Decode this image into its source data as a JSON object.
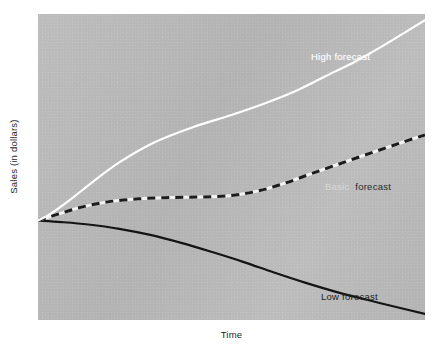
{
  "chart_data": {
    "type": "line",
    "title": "",
    "xlabel": "Time",
    "ylabel": "Sales (in dollars)",
    "grid": false,
    "legend_position": "inline-annotations",
    "xlim": [
      0,
      100
    ],
    "ylim": [
      0,
      100
    ],
    "background_color": "#b9b9b9",
    "axis_ticks": {
      "x": [],
      "y": []
    },
    "series": [
      {
        "name": "High forecast",
        "label": "High forecast",
        "style": "solid",
        "color": "#ffffff",
        "width": 2.2,
        "points": [
          {
            "x": 0,
            "y": 32.5
          },
          {
            "x": 3,
            "y": 34.5
          },
          {
            "x": 8,
            "y": 39.0
          },
          {
            "x": 14,
            "y": 45.0
          },
          {
            "x": 21,
            "y": 51.5
          },
          {
            "x": 30,
            "y": 58.0
          },
          {
            "x": 40,
            "y": 63.0
          },
          {
            "x": 50,
            "y": 67.0
          },
          {
            "x": 58,
            "y": 70.5
          },
          {
            "x": 66,
            "y": 74.5
          },
          {
            "x": 74,
            "y": 79.5
          },
          {
            "x": 82,
            "y": 84.5
          },
          {
            "x": 89,
            "y": 89.5
          },
          {
            "x": 95.5,
            "y": 94.5
          },
          {
            "x": 100,
            "y": 98.0
          }
        ]
      },
      {
        "name": "Basic forecast",
        "label": "Basic forecast",
        "style": "dashed",
        "color": "#1c1c1c",
        "gap_color": "#f2f2f2",
        "width": 3.0,
        "dash": [
          8,
          6
        ],
        "points": [
          {
            "x": 0,
            "y": 32.5
          },
          {
            "x": 5,
            "y": 34.5
          },
          {
            "x": 11,
            "y": 36.8
          },
          {
            "x": 18,
            "y": 38.6
          },
          {
            "x": 26,
            "y": 39.6
          },
          {
            "x": 34,
            "y": 40.0
          },
          {
            "x": 42,
            "y": 40.2
          },
          {
            "x": 50,
            "y": 40.7
          },
          {
            "x": 57,
            "y": 42.2
          },
          {
            "x": 64,
            "y": 44.8
          },
          {
            "x": 71,
            "y": 48.0
          },
          {
            "x": 79,
            "y": 51.5
          },
          {
            "x": 87,
            "y": 55.0
          },
          {
            "x": 94,
            "y": 58.0
          },
          {
            "x": 100,
            "y": 60.5
          }
        ]
      },
      {
        "name": "Low forecast",
        "label": "Low forecast",
        "style": "solid",
        "color": "#141414",
        "width": 2.2,
        "points": [
          {
            "x": 0,
            "y": 32.5
          },
          {
            "x": 6,
            "y": 32.0
          },
          {
            "x": 13,
            "y": 31.2
          },
          {
            "x": 21,
            "y": 29.8
          },
          {
            "x": 29,
            "y": 27.8
          },
          {
            "x": 37,
            "y": 25.2
          },
          {
            "x": 45,
            "y": 22.2
          },
          {
            "x": 53,
            "y": 19.0
          },
          {
            "x": 61,
            "y": 15.5
          },
          {
            "x": 69,
            "y": 12.2
          },
          {
            "x": 77,
            "y": 9.2
          },
          {
            "x": 85,
            "y": 6.6
          },
          {
            "x": 92,
            "y": 4.4
          },
          {
            "x": 100,
            "y": 2.0
          }
        ]
      }
    ],
    "annotations": [
      {
        "name": "high-forecast-label",
        "text": "High forecast",
        "color": "#fdfdfd",
        "x": 70.5,
        "y": 85.5
      },
      {
        "name": "basic-forecast-label",
        "text": "Basic",
        "text2": "forecast",
        "color": "#2b2b2b",
        "x": 74.0,
        "y": 43.0
      },
      {
        "name": "low-forecast-label",
        "text": "Low forecast",
        "color": "#232323",
        "x": 73.0,
        "y": 7.5
      }
    ]
  },
  "axes": {
    "y_title": "Sales (in dollars)",
    "x_title": "Time"
  },
  "labels": {
    "high": "High forecast",
    "basic_word1": "Basic",
    "basic_word2": "forecast",
    "low": "Low forecast"
  }
}
